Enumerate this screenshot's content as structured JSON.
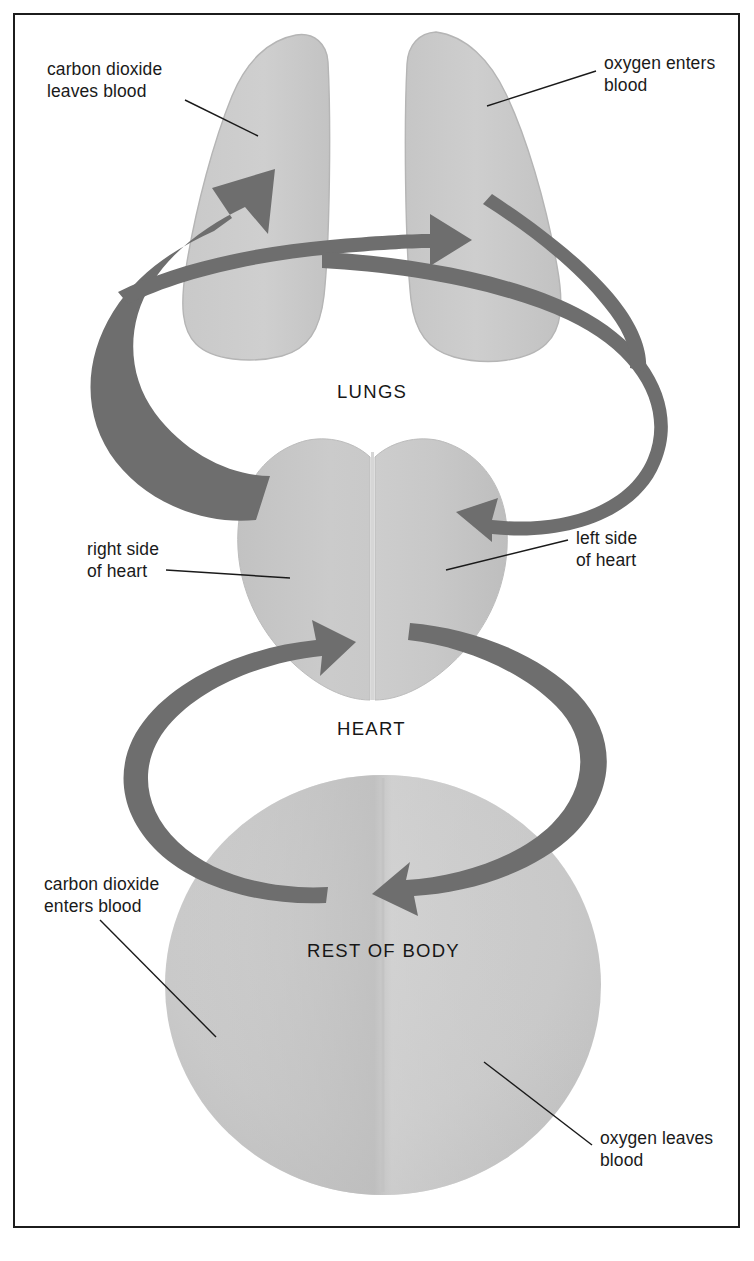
{
  "figure": {
    "title_shown": false,
    "background_color": "#ffffff",
    "frame_color": "#1c1c1c"
  },
  "palette": {
    "organ_fill_light": "#cfcfcf",
    "organ_fill_mid": "#c6c6c6",
    "organ_fill_dark": "#bdbdbd",
    "organ_edge": "#b0b0b0",
    "arrow_gray": "#6e6e6e",
    "leader_line": "#1a1a1a",
    "text_color": "#1a1a1a"
  },
  "organs": [
    {
      "id": "lungs",
      "label": "LUNGS",
      "label_x": 337,
      "label_y": 381
    },
    {
      "id": "heart",
      "label": "HEART",
      "label_x": 337,
      "label_y": 718
    },
    {
      "id": "rest-of-body",
      "label": "REST OF BODY",
      "label_x": 307,
      "label_y": 940
    }
  ],
  "annotations": [
    {
      "id": "carbon-dioxide-leaves-blood",
      "text": "carbon dioxide\nleaves blood",
      "x": 47,
      "y": 58,
      "leader": {
        "x1": 185,
        "y1": 100,
        "x2": 258,
        "y2": 136
      }
    },
    {
      "id": "oxygen-enters-blood",
      "text": "oxygen enters\nblood",
      "x": 604,
      "y": 52,
      "leader": {
        "x1": 487,
        "y1": 106,
        "x2": 596,
        "y2": 71
      }
    },
    {
      "id": "right-side-of-heart",
      "text": "right side\nof heart",
      "x": 87,
      "y": 538,
      "leader": {
        "x1": 166,
        "y1": 570,
        "x2": 290,
        "y2": 578
      }
    },
    {
      "id": "left-side-of-heart",
      "text": "left side\nof heart",
      "x": 576,
      "y": 527,
      "leader": {
        "x1": 446,
        "y1": 570,
        "x2": 568,
        "y2": 540
      }
    },
    {
      "id": "carbon-dioxide-enters-blood",
      "text": "carbon dioxide\nenters blood",
      "x": 44,
      "y": 873,
      "leader": {
        "x1": 100,
        "y1": 920,
        "x2": 216,
        "y2": 1037
      }
    },
    {
      "id": "oxygen-leaves-blood",
      "text": "oxygen leaves\nblood",
      "x": 600,
      "y": 1127,
      "leader": {
        "x1": 484,
        "y1": 1062,
        "x2": 592,
        "y2": 1145
      }
    }
  ],
  "flow": [
    {
      "id": "body-to-right-heart",
      "from": "rest-of-body",
      "to": "heart",
      "direction": "up-left-loop",
      "meaning": "deoxygenated blood returns from body to right side of heart"
    },
    {
      "id": "right-heart-to-lungs",
      "from": "heart",
      "to": "lungs",
      "direction": "up-left-loop",
      "meaning": "right side of heart pumps blood to lungs"
    },
    {
      "id": "lungs-to-left-heart",
      "from": "lungs",
      "to": "heart",
      "direction": "down-right-loop",
      "meaning": "oxygenated blood from lungs to left side of heart"
    },
    {
      "id": "left-heart-to-body",
      "from": "heart",
      "to": "rest-of-body",
      "direction": "down-right-loop",
      "meaning": "left side of heart pumps blood to rest of body"
    }
  ]
}
